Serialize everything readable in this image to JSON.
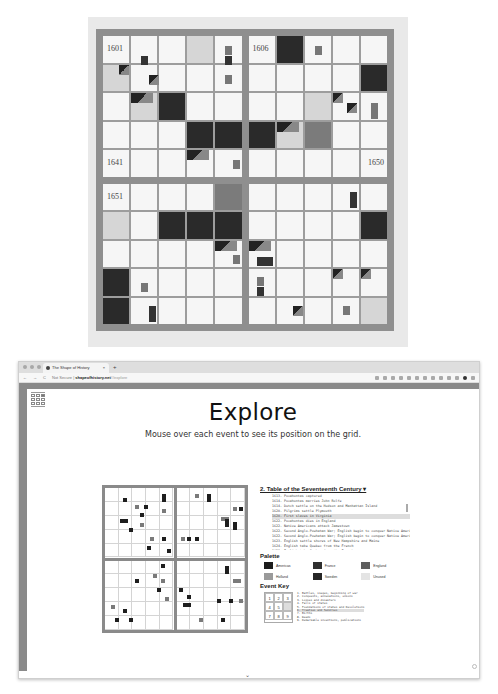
{
  "photo": {
    "labels": {
      "q1": "1601",
      "q2": "1606",
      "q3": "1641",
      "q4": "1650",
      "q5": "1651"
    }
  },
  "browser": {
    "tab_title": "The Shape of History",
    "tab_close": "×",
    "new_tab": "+",
    "nav": {
      "back": "←",
      "forward": "→",
      "reload": "C"
    },
    "url_security": "Not Secure",
    "url_host": "shapeofhistory.net",
    "url_path": "/#explore"
  },
  "page": {
    "title": "Explore",
    "subtitle": "Mouse over each event to see its position on the grid.",
    "table_title": "2. Table of the Seventeenth Century ▾",
    "events": [
      "1613. Pocahontas captured",
      "1614. Pocahontas marries John Rolfe",
      "1614. Dutch settle on the Hudson and Manhattan Island",
      "1620. Pilgrims settle Plymouth",
      "1620. First slaves in Virginia",
      "1622. Pocahontas dies in England",
      "1622. Native Americans attack Jamestown",
      "1622. Second Anglo-Powhatan War; English begin to conquer Native Americans",
      "1622. Second Anglo-Powhatan War; English begin to conquer Native Americans",
      "1623. English settle shores of New Hampshire and Maine",
      "1624. English take Quebec from the French",
      "1629. English take Quebec from the French"
    ],
    "selected_event_index": 4,
    "palette_heading": "Palette",
    "palette": [
      {
        "label": "Americas",
        "color": "#1c1c1c"
      },
      {
        "label": "France",
        "color": "#2f2f2f"
      },
      {
        "label": "England",
        "color": "#5e5e5e"
      },
      {
        "label": "Holland",
        "color": "#9a9a9a"
      },
      {
        "label": "Sweden",
        "color": "#262626"
      },
      {
        "label": "Unused",
        "color": "#e4e4e4"
      }
    ],
    "event_key_heading": "Event Key",
    "event_key_cells": [
      "1",
      "2",
      "3",
      "4",
      "5",
      "",
      "7",
      "8",
      "9"
    ],
    "event_key_list": [
      "1. Battles, sieges, beginning of war",
      "2. Conquests, annexations, unions",
      "3. Losses and disasters",
      "4. Falls of states",
      "5. Foundations of states and Revolutions",
      "6. Treaties and Sundries",
      "7. Births",
      "8. Deeds",
      "9. Remarkable inventions, publications"
    ],
    "event_key_selected": 5,
    "scroll_hint": "⌄"
  }
}
